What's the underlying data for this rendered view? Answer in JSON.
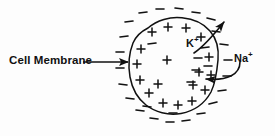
{
  "figure": {
    "background_color": "#fdfdfd",
    "ink_color": "#111111"
  },
  "labels": {
    "membrane": "Cell Membrane",
    "potassium_ion": "K",
    "potassium_charge": "+",
    "sodium_ion": "Na",
    "sodium_charge": "+"
  },
  "diagram": {
    "cell_outline": {
      "shape": "irregular-closed-blob",
      "center_x": 174,
      "center_y": 67,
      "radius_x": 44,
      "radius_y": 48
    },
    "inner_charges": {
      "symbol": "+",
      "meaning": "positive charges lining the inner face of the membrane",
      "positions": [
        [
          152,
          32
        ],
        [
          168,
          27
        ],
        [
          186,
          28
        ],
        [
          201,
          37
        ],
        [
          141,
          49
        ],
        [
          137,
          64
        ],
        [
          140,
          80
        ],
        [
          149,
          93
        ],
        [
          163,
          103
        ],
        [
          178,
          105
        ],
        [
          192,
          101
        ],
        [
          205,
          90
        ],
        [
          211,
          75
        ],
        [
          209,
          57
        ],
        [
          199,
          72
        ],
        [
          193,
          85
        ],
        [
          158,
          84
        ],
        [
          167,
          60
        ]
      ]
    },
    "outer_charges": {
      "symbol": "–",
      "meaning": "negative charges scattered in extracellular fluid",
      "positions": [
        [
          143,
          13
        ],
        [
          160,
          9
        ],
        [
          179,
          8
        ],
        [
          196,
          12
        ],
        [
          211,
          18
        ],
        [
          129,
          22
        ],
        [
          124,
          37
        ],
        [
          120,
          52
        ],
        [
          120,
          68
        ],
        [
          123,
          84
        ],
        [
          130,
          98
        ],
        [
          140,
          110
        ],
        [
          154,
          118
        ],
        [
          170,
          122
        ],
        [
          186,
          121
        ],
        [
          201,
          114
        ],
        [
          213,
          104
        ],
        [
          222,
          91
        ],
        [
          227,
          76
        ],
        [
          228,
          60
        ],
        [
          224,
          44
        ],
        [
          216,
          31
        ],
        [
          205,
          48
        ],
        [
          198,
          58
        ],
        [
          196,
          70
        ],
        [
          191,
          82
        ],
        [
          152,
          44
        ],
        [
          147,
          106
        ],
        [
          173,
          113
        ],
        [
          208,
          66
        ]
      ]
    },
    "arrows": [
      {
        "name": "membrane-pointer",
        "style": "straight",
        "from": [
          83,
          62
        ],
        "to": [
          132,
          62
        ],
        "direction": "points right at membrane"
      },
      {
        "name": "potassium-efflux",
        "style": "curved",
        "from": [
          196,
          52
        ],
        "to": [
          228,
          18
        ],
        "direction": "outward across membrane"
      },
      {
        "name": "sodium-influx",
        "style": "curved",
        "from": [
          238,
          62
        ],
        "to": [
          198,
          79
        ],
        "direction": "inward across membrane"
      }
    ]
  }
}
